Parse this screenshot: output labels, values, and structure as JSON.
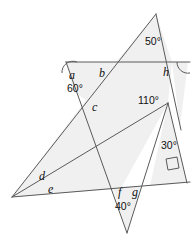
{
  "figure": {
    "canvas": {
      "width": 195,
      "height": 238
    },
    "colors": {
      "fill": "#f0f0f0",
      "stroke": "#5a5a5a",
      "text": "#111111",
      "background": "#ffffff"
    },
    "variable_labels": [
      {
        "name": "a",
        "text": "a",
        "x": 69,
        "y": 79
      },
      {
        "name": "b",
        "text": "b",
        "x": 99,
        "y": 77
      },
      {
        "name": "h",
        "text": "h",
        "x": 163,
        "y": 76
      },
      {
        "name": "c",
        "text": "c",
        "x": 92,
        "y": 111
      },
      {
        "name": "d",
        "text": "d",
        "x": 39,
        "y": 180
      },
      {
        "name": "e",
        "text": "e",
        "x": 48,
        "y": 193
      },
      {
        "name": "f",
        "text": "f",
        "x": 118,
        "y": 196
      },
      {
        "name": "g",
        "text": "g",
        "x": 132,
        "y": 196
      }
    ],
    "angle_labels": [
      {
        "name": "angle-50",
        "text": "50°",
        "x": 145,
        "y": 45
      },
      {
        "name": "angle-60",
        "text": "60°",
        "x": 67,
        "y": 92
      },
      {
        "name": "angle-110",
        "text": "110°",
        "x": 142,
        "y": 104
      },
      {
        "name": "angle-30",
        "text": "30°",
        "x": 163,
        "y": 149
      },
      {
        "name": "angle-40",
        "text": "40°",
        "x": 121,
        "y": 210
      }
    ],
    "vertices": {
      "top_apex": {
        "x": 156,
        "y": 14
      },
      "top_left": {
        "x": 66,
        "y": 62
      },
      "top_right": {
        "x": 188,
        "y": 62
      },
      "left_far": {
        "x": 12,
        "y": 197
      },
      "mid_right": {
        "x": 168,
        "y": 103
      },
      "bottom_apex": {
        "x": 127,
        "y": 233
      },
      "lower_right": {
        "x": 187,
        "y": 182
      }
    },
    "segments": [
      {
        "name": "horizontal-top",
        "x1": 66,
        "y1": 62,
        "x2": 190,
        "y2": 62
      },
      {
        "name": "apex-to-lowerleft",
        "x1": 156,
        "y1": 14,
        "x2": 12,
        "y2": 197
      },
      {
        "name": "apex-to-lowerright",
        "x1": 156,
        "y1": 14,
        "x2": 180,
        "y2": 126
      },
      {
        "name": "topleft-to-bottomapex",
        "x1": 66,
        "y1": 62,
        "x2": 127,
        "y2": 233
      },
      {
        "name": "leftfar-to-midright",
        "x1": 12,
        "y1": 197,
        "x2": 168,
        "y2": 103
      },
      {
        "name": "leftfar-to-lowerright",
        "x1": 12,
        "y1": 197,
        "x2": 190,
        "y2": 182
      },
      {
        "name": "midright-to-bottomapex",
        "x1": 168,
        "y1": 103,
        "x2": 127,
        "y2": 233
      },
      {
        "name": "midright-to-lowerright",
        "x1": 168,
        "y1": 103,
        "x2": 187,
        "y2": 183
      }
    ],
    "markers": {
      "right_angle": {
        "name": "right-angle-square",
        "x": 167,
        "y": 160,
        "size": 11
      },
      "arcs": [
        {
          "name": "arc-top-left-vertex",
          "cx": 66,
          "cy": 62,
          "r": 11
        },
        {
          "name": "arc-top-right-vertex",
          "cx": 188,
          "cy": 62,
          "r": 11
        }
      ]
    }
  }
}
